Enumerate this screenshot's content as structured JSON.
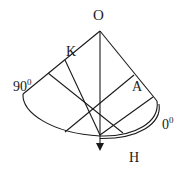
{
  "diagram": {
    "type": "geometry-sector",
    "labels": {
      "apex": "O",
      "left_point": "K",
      "right_point": "A",
      "bottom_point": "H",
      "left_angle": "90",
      "left_angle_sup": "0",
      "right_angle": "0",
      "right_angle_sup": "0"
    },
    "colors": {
      "stroke": "#1a1a1a",
      "background": "#ffffff"
    }
  }
}
